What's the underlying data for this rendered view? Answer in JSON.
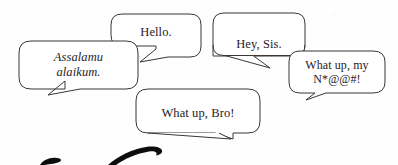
{
  "scene": {
    "width": 398,
    "height": 165,
    "background_color": "#fefefe",
    "outline_color": "#3a3734",
    "text_color": "#25211f",
    "ink_color": "#0d0d0d"
  },
  "bubbles": [
    {
      "id": "assalamu",
      "text": "Assalamu\nalaikum.",
      "style": "italic",
      "tail_direction": "down-left"
    },
    {
      "id": "hello",
      "text": "Hello.",
      "style": "roman",
      "tail_direction": "down-left"
    },
    {
      "id": "hey-sis",
      "text": "Hey, Sis.",
      "style": "roman",
      "tail_direction": "down-right"
    },
    {
      "id": "whatup-my",
      "text": "What up, my\nN*@@#!",
      "style": "roman",
      "tail_direction": "down-left"
    },
    {
      "id": "whatup-bro",
      "text": "What up, Bro!",
      "style": "roman",
      "tail_direction": "down-left"
    }
  ],
  "handwriting": {
    "description": "cut-off tops of black script handwriting along bottom edge"
  }
}
